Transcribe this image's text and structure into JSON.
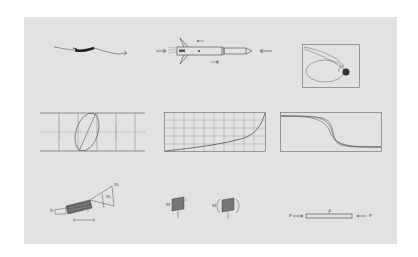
{
  "figure": {
    "background": "#ffffff",
    "panel_color": "#e2e2e2",
    "line_color": "#444444",
    "panels": [
      {
        "id": "aircraft-flight-path",
        "row": 1,
        "col": 1,
        "description": "Aircraft with wavy flight path"
      },
      {
        "id": "rocket-under-compression",
        "row": 1,
        "col": 2,
        "description": "Rocket/missile with axial compressive forces and exhaust"
      },
      {
        "id": "orbit-trajectory",
        "row": 1,
        "col": 3,
        "description": "Elliptical orbit and escape trajectory around a dark planet, boxed"
      },
      {
        "id": "ellipse-oscilloscope",
        "row": 2,
        "col": 1,
        "description": "Lissajous ellipse with diagonal line on dashed grid"
      },
      {
        "id": "exponential-curve-grid",
        "row": 2,
        "col": 2,
        "description": "Monotonic rising curve on square grid"
      },
      {
        "id": "sigmoid-family",
        "row": 2,
        "col": 3,
        "description": "Three decreasing sigmoid curves in a box"
      },
      {
        "id": "force-vector-diagram",
        "row": 3,
        "col": 1,
        "description": "Beam segment with force triangle and labeled vectors"
      },
      {
        "id": "plate-bending-moments",
        "row": 3,
        "col": 2,
        "description": "Two shaded plate elements with applied moments"
      },
      {
        "id": "axially-loaded-bar",
        "row": 3,
        "col": 3,
        "description": "Horizontal bar under opposing axial loads"
      }
    ],
    "labels": {
      "vec_a": "N",
      "vec_b": "N₁",
      "vec_c": "N₂",
      "moment_a": "M",
      "moment_b": "M",
      "load_left": "P",
      "load_right": "P",
      "bar_label": "L"
    }
  }
}
